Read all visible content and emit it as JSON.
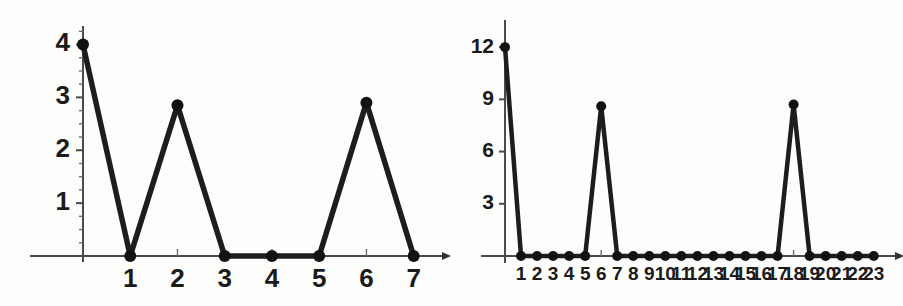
{
  "figure": {
    "background_color": "#fdfdfc",
    "ink_color": "#1d1d1d",
    "axis_color": "#4a4a4a",
    "panel_count": 2
  },
  "chart_data": [
    {
      "id": "left",
      "type": "line",
      "title": "",
      "xlabel": "",
      "ylabel": "",
      "grid": false,
      "legend": null,
      "x": [
        0,
        1,
        2,
        3,
        4,
        5,
        6,
        7
      ],
      "values": [
        4,
        0,
        2.85,
        0,
        0,
        0,
        2.9,
        0
      ],
      "x_tick_labels": [
        "1",
        "2",
        "3",
        "4",
        "5",
        "6",
        "7"
      ],
      "x_tick_values": [
        1,
        2,
        3,
        4,
        5,
        6,
        7
      ],
      "y_tick_labels": [
        "1",
        "2",
        "3",
        "4"
      ],
      "y_tick_values": [
        1,
        2,
        3,
        4
      ],
      "y_minor_count_per_major": 4,
      "xlim": [
        0,
        7.6
      ],
      "ylim": [
        0,
        4.35
      ],
      "markers": true,
      "marker_radius_px": 6
    },
    {
      "id": "right",
      "type": "line",
      "title": "",
      "xlabel": "",
      "ylabel": "",
      "grid": false,
      "legend": null,
      "x": [
        0,
        1,
        2,
        3,
        4,
        5,
        6,
        7,
        8,
        9,
        10,
        11,
        12,
        13,
        14,
        15,
        16,
        17,
        18,
        19,
        20,
        21,
        22,
        23
      ],
      "values": [
        12,
        0,
        0,
        0,
        0,
        0,
        8.6,
        0,
        0,
        0,
        0,
        0,
        0,
        0,
        0,
        0,
        0,
        0,
        8.7,
        0,
        0,
        0,
        0,
        0
      ],
      "x_tick_labels": [
        "1",
        "2",
        "3",
        "4",
        "5",
        "6",
        "7",
        "8",
        "9",
        "10",
        "11",
        "12",
        "13",
        "14",
        "15",
        "16",
        "17",
        "18",
        "19",
        "20",
        "21",
        "22",
        "23"
      ],
      "x_tick_values": [
        1,
        2,
        3,
        4,
        5,
        6,
        7,
        8,
        9,
        10,
        11,
        12,
        13,
        14,
        15,
        16,
        17,
        18,
        19,
        20,
        21,
        22,
        23
      ],
      "y_tick_labels": [
        "3",
        "6",
        "9",
        "12"
      ],
      "y_tick_values": [
        3,
        6,
        9,
        12
      ],
      "y_minor_count_per_major": 0,
      "xlim": [
        0,
        24.2
      ],
      "ylim": [
        0,
        13.1
      ],
      "markers": true,
      "marker_radius_px": 5
    }
  ]
}
